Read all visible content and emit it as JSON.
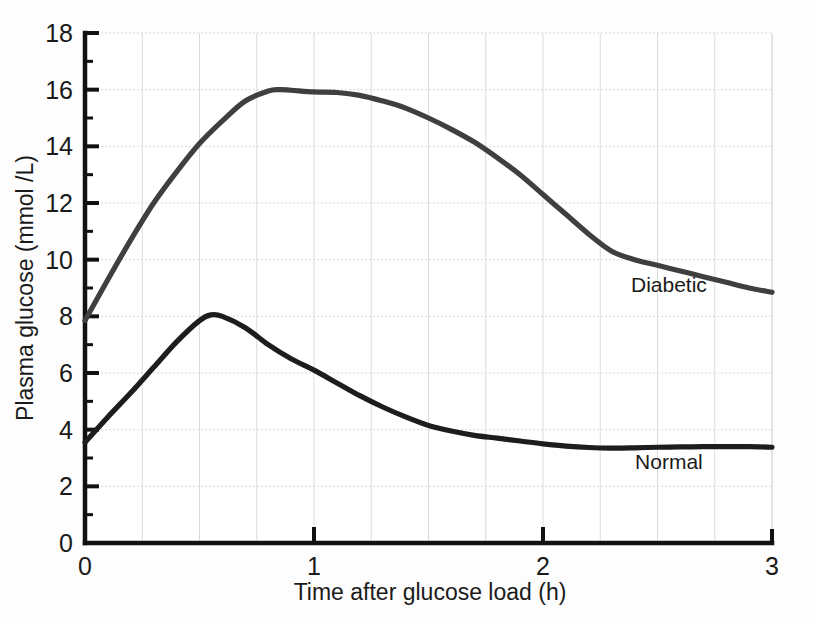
{
  "chart_data": {
    "type": "line",
    "title": "",
    "xlabel": "Time after glucose load (h)",
    "ylabel": "Plasma glucose (mmol /L)",
    "xlim": [
      0,
      3
    ],
    "ylim": [
      0,
      18
    ],
    "xticks": [
      0,
      1,
      2,
      3
    ],
    "xtick_labels": [
      "0",
      "1",
      "2",
      "3"
    ],
    "yticks": [
      0,
      2,
      4,
      6,
      8,
      10,
      12,
      14,
      16,
      18
    ],
    "ytick_labels": [
      "0",
      "2",
      "4",
      "6",
      "8",
      "10",
      "12",
      "14",
      "16",
      "18"
    ],
    "y_minor_ticks": [
      1,
      3,
      5,
      7,
      9,
      11,
      13,
      15,
      17
    ],
    "x_gridlines": [
      0.25,
      0.5,
      0.75,
      1,
      1.25,
      1.5,
      1.75,
      2,
      2.25,
      2.5,
      2.75,
      3
    ],
    "grid": true,
    "legend_position": "inline-annotation",
    "series": [
      {
        "name": "Diabetic",
        "color": "#3f3f3f",
        "label_x": 2.55,
        "label_y": 8.85,
        "x": [
          0,
          0.1,
          0.2,
          0.3,
          0.4,
          0.5,
          0.6,
          0.7,
          0.8,
          0.85,
          0.9,
          1.0,
          1.1,
          1.2,
          1.3,
          1.4,
          1.5,
          1.6,
          1.7,
          1.8,
          1.9,
          2.0,
          2.1,
          2.2,
          2.3,
          2.4,
          2.5,
          2.6,
          2.7,
          2.8,
          2.9,
          3.0
        ],
        "y": [
          7.85,
          9.3,
          10.7,
          12.0,
          13.1,
          14.1,
          14.9,
          15.6,
          15.95,
          16.0,
          15.98,
          15.92,
          15.9,
          15.8,
          15.6,
          15.35,
          15.0,
          14.6,
          14.15,
          13.6,
          13.0,
          12.3,
          11.6,
          10.9,
          10.3,
          10.0,
          9.8,
          9.6,
          9.4,
          9.2,
          9.0,
          8.85
        ]
      },
      {
        "name": "Normal",
        "color": "#1d1d1d",
        "label_x": 2.55,
        "label_y": 2.6,
        "x": [
          0,
          0.1,
          0.2,
          0.3,
          0.4,
          0.5,
          0.55,
          0.6,
          0.7,
          0.8,
          0.9,
          1.0,
          1.1,
          1.2,
          1.3,
          1.4,
          1.5,
          1.6,
          1.7,
          1.8,
          1.9,
          2.0,
          2.1,
          2.2,
          2.3,
          2.4,
          2.5,
          2.6,
          2.7,
          2.8,
          2.9,
          3.0
        ],
        "y": [
          3.55,
          4.45,
          5.3,
          6.2,
          7.1,
          7.85,
          8.05,
          8.0,
          7.6,
          7.0,
          6.5,
          6.1,
          5.65,
          5.2,
          4.8,
          4.45,
          4.15,
          3.95,
          3.8,
          3.7,
          3.6,
          3.5,
          3.42,
          3.37,
          3.35,
          3.36,
          3.38,
          3.39,
          3.4,
          3.4,
          3.4,
          3.38
        ]
      }
    ],
    "annotations": [
      {
        "text": "Diabetic",
        "x": 2.55,
        "y": 8.85
      },
      {
        "text": "Normal",
        "x": 2.55,
        "y": 2.6
      }
    ]
  },
  "axis": {
    "y_title": "Plasma glucose (mmol /L)",
    "x_title": "Time after glucose load (h)"
  }
}
